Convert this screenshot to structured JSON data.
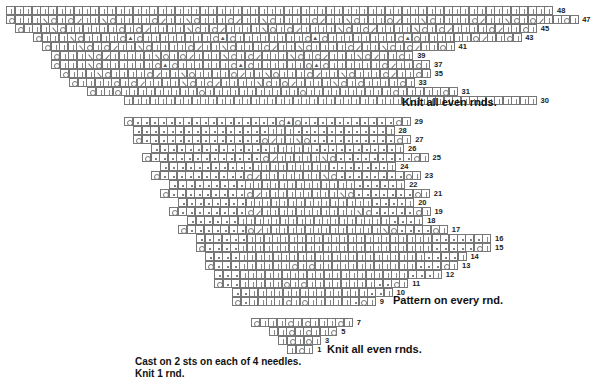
{
  "legend_symbols": {
    "|": "knit-icon",
    "o": "yarn-over-icon",
    "/": "k2tog-icon",
    "\\": "ssk-icon",
    "A": "double-decrease-icon",
    ".": "purl-icon"
  },
  "charts": {
    "top": {
      "cell": 9.1,
      "rows": [
        {
          "num": "48",
          "x": 7,
          "y": 6,
          "cells": "|||||||||||||||||||||||||||||||||||||||||||||||||||||||||||||||||"
        },
        {
          "num": "47",
          "x": 7,
          "y": 15,
          "cells": "o|||\\o|o/||\\o||||o/||\\o|||o/||\\o||||o/||\\o|||o/||\\o||||o/||\\o|o/||o|"
        },
        {
          "num": "45",
          "x": 16,
          "y": 24,
          "cells": "o|||\\o||||||o|o/||||\\o|o/||||\\o|o/||||\\o|o/||||\\o|o/||||o/||o|"
        },
        {
          "num": "43",
          "x": 34,
          "y": 33,
          "cells": "o|||\\o||||oAo||||||||oAo||||||||oAo||||||||oAo||||||o/||o|"
        },
        {
          "num": "41",
          "x": 43,
          "y": 42,
          "cells": "o|||\\o|o/||\\o||||o/||\\o|||o/||\\o||||o/||\\o|o/||o|"
        },
        {
          "num": "39",
          "x": 52,
          "y": 51,
          "cells": "o|||\\o/|||||\\o|o/|||\\o|o/|||\\o|o/|||\\o/||o|"
        },
        {
          "num": "37",
          "x": 52,
          "y": 60,
          "cells": "o|||\\o||||||oAo||||||oAo||||||oAo||||||o/||o|"
        },
        {
          "num": "35",
          "x": 61,
          "y": 69,
          "cells": "o|||\\o||||o/||\\o||||o/||\\o|||o/||\\o|||o/||o|"
        },
        {
          "num": "33",
          "x": 70,
          "y": 78,
          "cells": "o||||o|o/||||\\o|o/||||\\o|o/||||\\o|o||||o|"
        },
        {
          "num": "31",
          "x": 88,
          "y": 87,
          "cells": "o||o|||||||||o|||||||||||o||||||||||o|||||o|"
        },
        {
          "num": "30",
          "x": 125,
          "y": 96,
          "cells": "|||||||||||||||||||||||||||||||||||||||||||||||||"
        }
      ],
      "note": "Knit all even rnds."
    },
    "middle": {
      "rows": [
        {
          "num": "29",
          "x": 125,
          "y": 117,
          "cells": "o.................oAo...........o|"
        },
        {
          "num": "28",
          "x": 134,
          "y": 126,
          "cells": "................|||...........|"
        },
        {
          "num": "27",
          "x": 134,
          "y": 135,
          "cells": "o..............o/||\\o..........o|"
        },
        {
          "num": "26",
          "x": 152,
          "y": 144,
          "cells": "..............|||||..........|"
        },
        {
          "num": "25",
          "x": 143,
          "y": 153,
          "cells": "o.............o/|||||\\o.........o|"
        },
        {
          "num": "24",
          "x": 161,
          "y": 162,
          "cells": "...........|||||||||.......|"
        },
        {
          "num": "23",
          "x": 152,
          "y": 171,
          "cells": "o..........o/|||||||\\o........o|"
        },
        {
          "num": "22",
          "x": 170,
          "y": 180,
          "cells": ".........|||||||||||||.....|"
        },
        {
          "num": "21",
          "x": 161,
          "y": 189,
          "cells": "o.........o/|||||||||\\o.......o|"
        },
        {
          "num": "20",
          "x": 179,
          "y": 198,
          "cells": "........|||||||||||||||....|"
        },
        {
          "num": "19",
          "x": 170,
          "y": 207,
          "cells": "o........o/|||||||||||\\o.....o|"
        },
        {
          "num": "18",
          "x": 188,
          "y": 216,
          "cells": "......||||||||||||||||||...|"
        },
        {
          "num": "17",
          "x": 179,
          "y": 225,
          "cells": "o.......o/||||||||||||||\\o....o|"
        },
        {
          "num": "16",
          "x": 197,
          "y": 234,
          "cells": "......||||||||||||||||||||||......|"
        },
        {
          "num": "15",
          "x": 197,
          "y": 243,
          "cells": "o....|||||||||||||||||||||||.....o|"
        },
        {
          "num": "14",
          "x": 206,
          "y": 252,
          "cells": "....||||||||||||||||||||||....|"
        },
        {
          "num": "13",
          "x": 206,
          "y": 261,
          "cells": "o...||||||o|o||||||||||||...o|"
        },
        {
          "num": "12",
          "x": 215,
          "y": 270,
          "cells": "...||||||||||||||||||||...|"
        },
        {
          "num": "11",
          "x": 215,
          "y": 279,
          "cells": "o..|||||o|o||||||||..o|"
        },
        {
          "num": "10",
          "x": 233,
          "y": 288,
          "cells": "..||||||||||||||..|"
        },
        {
          "num": "9",
          "x": 233,
          "y": 297,
          "cells": "o.||||o|o|||||.o|"
        }
      ],
      "note": "Pattern on every rnd."
    },
    "bottom": {
      "rows": [
        {
          "num": "7",
          "x": 252,
          "y": 318,
          "cells": "o|||o|o|||o|"
        },
        {
          "num": "5",
          "x": 270,
          "y": 327,
          "cells": "||o|o||o"
        },
        {
          "num": "3",
          "x": 279,
          "y": 336,
          "cells": "|o|o|"
        },
        {
          "num": "1",
          "x": 288,
          "y": 345,
          "cells": "|o|"
        }
      ],
      "note": "Knit all even rnds."
    }
  },
  "instructions": {
    "line1": "Cast on 2 sts on each of 4 needles.",
    "line2": "Knit 1 rnd."
  }
}
